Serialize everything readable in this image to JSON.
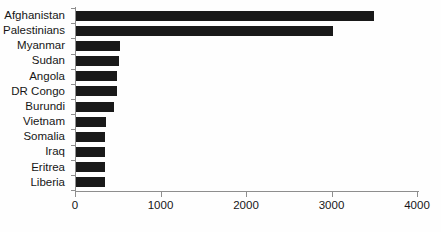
{
  "chart_data": {
    "type": "bar",
    "orientation": "horizontal",
    "title": "",
    "xlabel": "",
    "ylabel": "",
    "categories": [
      "Afghanistan",
      "Palestinians",
      "Myanmar",
      "Sudan",
      "Angola",
      "DR Congo",
      "Burundi",
      "Vietnam",
      "Somalia",
      "Iraq",
      "Eritrea",
      "Liberia"
    ],
    "values": [
      3485,
      3000,
      520,
      500,
      480,
      480,
      450,
      350,
      340,
      340,
      340,
      340
    ],
    "xlim": [
      0,
      4000
    ],
    "xticks": [
      0,
      1000,
      2000,
      3000,
      4000
    ],
    "xtick_labels": [
      "0",
      "1000",
      "2000",
      "3000",
      "4000"
    ],
    "grid": false,
    "legend": null,
    "bar_color": "#191919",
    "axis_color": "#8e8e8e",
    "text_color": "#161616"
  }
}
